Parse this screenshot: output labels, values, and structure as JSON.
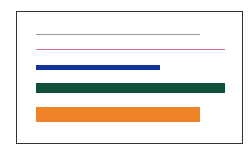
{
  "figure": {
    "frame": {
      "border_color": "#333333"
    },
    "lines": [
      {
        "name": "gray-line",
        "color": "#9a9aa6",
        "x": 36,
        "y": 34,
        "width": 164,
        "thickness": 1
      },
      {
        "name": "pink-line",
        "color": "#e0708a",
        "x": 36,
        "y": 49,
        "width": 189,
        "thickness": 1
      },
      {
        "name": "blue-bar",
        "color": "#12339a",
        "x": 36,
        "y": 65,
        "width": 124,
        "thickness": 5
      },
      {
        "name": "green-bar",
        "color": "#0f4f3c",
        "x": 36,
        "y": 83,
        "width": 189,
        "thickness": 10
      },
      {
        "name": "orange-bar",
        "color": "#f08228",
        "x": 36,
        "y": 107,
        "width": 164,
        "thickness": 15
      }
    ]
  }
}
